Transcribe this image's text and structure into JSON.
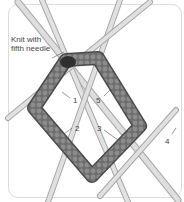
{
  "diagram": {
    "colors": {
      "needle": "#d6d6d6",
      "needle_edge": "#a8a8a8",
      "knitting": "#7a7a7a",
      "knitting_dark": "#4a4a4a",
      "label": "#444444",
      "frame": "#dcdcdc"
    },
    "labels": {
      "callout": [
        "Knit with",
        "fifth needle"
      ],
      "n1": "1",
      "n2": "2",
      "n3": "3",
      "n4": "4",
      "n5": "5"
    }
  }
}
